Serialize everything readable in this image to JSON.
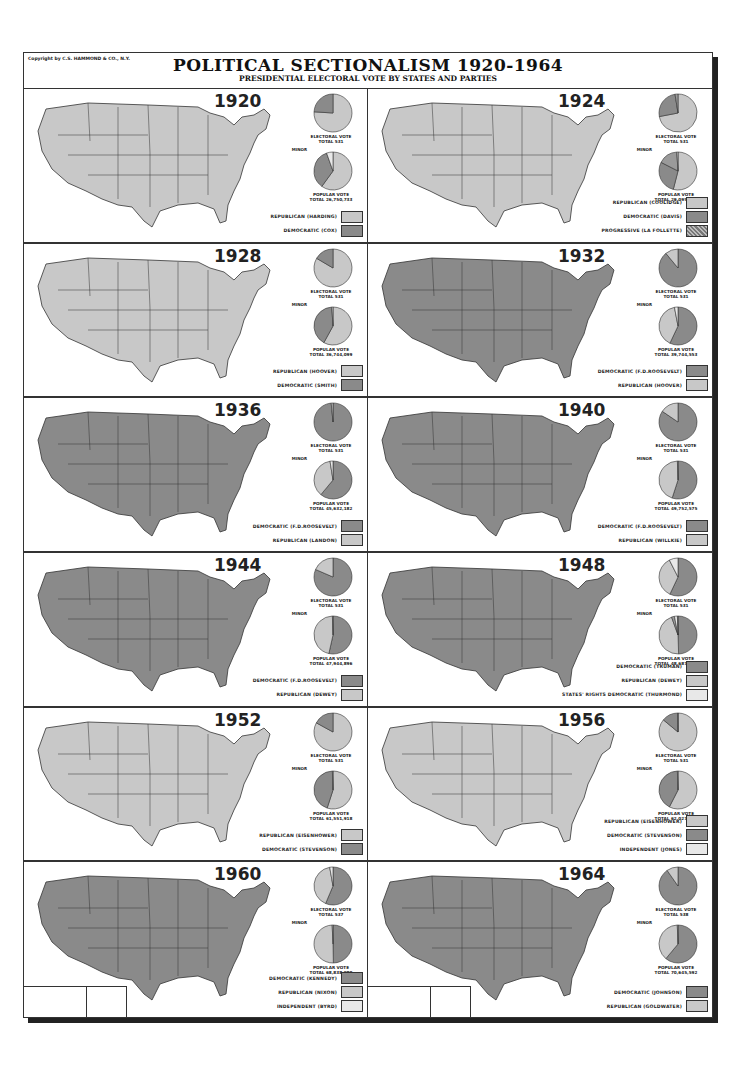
{
  "header": {
    "copyright": "Copyright by C.S. HAMMOND & CO., N.Y.",
    "title": "POLITICAL SECTIONALISM 1920-1964",
    "subtitle": "PRESIDENTIAL ELECTORAL VOTE BY STATES AND PARTIES"
  },
  "colors": {
    "republican": "#c8c8c8",
    "democratic": "#8a8a8a",
    "third": "#e8e8e8",
    "border": "#333333"
  },
  "panels": [
    {
      "year": "1920",
      "electoral_label": "ELECTORAL VOTE",
      "electoral_total": "TOTAL 531",
      "popular_label": "POPULAR VOTE",
      "popular_total": "TOTAL 26,750,733",
      "minor_label": "MINOR",
      "minor_text": "5 1/2% 1,466,170",
      "legend": [
        {
          "label": "REPUBLICAN (HARDING)",
          "party": "rep"
        },
        {
          "label": "DEMOCRATIC (COX)",
          "party": "dem"
        }
      ]
    },
    {
      "year": "1924",
      "electoral_label": "ELECTORAL VOTE",
      "electoral_total": "TOTAL 531",
      "popular_label": "POPULAR VOTE",
      "popular_total": "TOTAL 29,095,209",
      "minor_label": "MINOR",
      "minor_text": "1% 155,800 / 16 1/2% 4,822,856",
      "legend": [
        {
          "label": "REPUBLICAN (COOLIDGE)",
          "party": "rep"
        },
        {
          "label": "DEMOCRATIC (DAVIS)",
          "party": "dem"
        },
        {
          "label": "PROGRESSIVE (LA FOLLETTE)",
          "party": "prog"
        }
      ]
    },
    {
      "year": "1928",
      "electoral_label": "ELECTORAL VOTE",
      "electoral_total": "TOTAL 531",
      "popular_label": "POPULAR VOTE",
      "popular_total": "TOTAL 36,744,099",
      "minor_label": "MINOR",
      "minor_text": "1% 337,115",
      "legend": [
        {
          "label": "REPUBLICAN (HOOVER)",
          "party": "rep"
        },
        {
          "label": "DEMOCRATIC (SMITH)",
          "party": "dem"
        }
      ]
    },
    {
      "year": "1932",
      "electoral_label": "ELECTORAL VOTE",
      "electoral_total": "TOTAL 531",
      "popular_label": "POPULAR VOTE",
      "popular_total": "TOTAL 39,744,553",
      "minor_label": "MINOR",
      "minor_text": "3% 1,160,615",
      "legend": [
        {
          "label": "DEMOCRATIC (F.D.ROOSEVELT)",
          "party": "dem"
        },
        {
          "label": "REPUBLICAN (HOOVER)",
          "party": "rep"
        }
      ]
    },
    {
      "year": "1936",
      "electoral_label": "ELECTORAL VOTE",
      "electoral_total": "TOTAL 531",
      "popular_label": "POPULAR VOTE",
      "popular_total": "TOTAL 45,632,182",
      "minor_label": "MINOR",
      "minor_text": "2 1/2% 1,208,083",
      "legend": [
        {
          "label": "DEMOCRATIC (F.D.ROOSEVELT)",
          "party": "dem"
        },
        {
          "label": "REPUBLICAN (LANDON)",
          "party": "rep"
        }
      ]
    },
    {
      "year": "1940",
      "electoral_label": "ELECTORAL VOTE",
      "electoral_total": "TOTAL 531",
      "popular_label": "POPULAR VOTE",
      "popular_total": "TOTAL 49,752,575",
      "minor_label": "MINOR",
      "minor_text": "1/2% 203,626",
      "legend": [
        {
          "label": "DEMOCRATIC (F.D.ROOSEVELT)",
          "party": "dem"
        },
        {
          "label": "REPUBLICAN (WILLKIE)",
          "party": "rep"
        }
      ]
    },
    {
      "year": "1944",
      "electoral_label": "ELECTORAL VOTE",
      "electoral_total": "TOTAL 531",
      "popular_label": "POPULAR VOTE",
      "popular_total": "TOTAL 47,944,896",
      "minor_label": "MINOR",
      "minor_text": "1/2% 346,651",
      "legend": [
        {
          "label": "DEMOCRATIC (F.D.ROOSEVELT)",
          "party": "dem"
        },
        {
          "label": "REPUBLICAN (DEWEY)",
          "party": "rep"
        }
      ]
    },
    {
      "year": "1948",
      "electoral_label": "ELECTORAL VOTE",
      "electoral_total": "TOTAL 531",
      "popular_label": "POPULAR VOTE",
      "popular_total": "TOTAL 48,687,498",
      "minor_label": "MINOR",
      "minor_text": "1/2% 289,609 / PROGRESSIVE (WALLACE) 2 1/2% 1,157,172 / 2 1/2% 1,169,021",
      "legend": [
        {
          "label": "DEMOCRATIC (TRUMAN)",
          "party": "dem"
        },
        {
          "label": "REPUBLICAN (DEWEY)",
          "party": "rep"
        },
        {
          "label": "STATES' RIGHTS DEMOCRATIC (THURMOND)",
          "party": "third"
        }
      ]
    },
    {
      "year": "1952",
      "electoral_label": "ELECTORAL VOTE",
      "electoral_total": "TOTAL 531",
      "popular_label": "POPULAR VOTE",
      "popular_total": "TOTAL 61,551,918",
      "minor_label": "MINOR",
      "minor_text": "1/2% 289,839",
      "legend": [
        {
          "label": "REPUBLICAN (EISENHOWER)",
          "party": "rep"
        },
        {
          "label": "DEMOCRATIC (STEVENSON)",
          "party": "dem"
        }
      ]
    },
    {
      "year": "1956",
      "electoral_label": "ELECTORAL VOTE",
      "electoral_total": "TOTAL 531",
      "popular_label": "POPULAR VOTE",
      "popular_total": "TOTAL 62,027,040",
      "minor_label": "MINOR",
      "minor_text": "1/2% 414,712",
      "legend": [
        {
          "label": "REPUBLICAN (EISENHOWER)",
          "party": "rep"
        },
        {
          "label": "DEMOCRATIC (STEVENSON)",
          "party": "dem"
        },
        {
          "label": "INDEPENDENT (JONES)",
          "party": "third"
        }
      ]
    },
    {
      "year": "1960",
      "electoral_label": "ELECTORAL VOTE",
      "electoral_total": "TOTAL 537",
      "popular_label": "POPULAR VOTE",
      "popular_total": "TOTAL 68,838,980",
      "minor_label": "MINOR",
      "minor_text": ".7% 503,643",
      "legend": [
        {
          "label": "DEMOCRATIC (KENNEDY)",
          "party": "dem"
        },
        {
          "label": "REPUBLICAN (NIXON)",
          "party": "rep"
        },
        {
          "label": "INDEPENDENT (BYRD)",
          "party": "third"
        }
      ]
    },
    {
      "year": "1964",
      "electoral_label": "ELECTORAL VOTE",
      "electoral_total": "TOTAL 538",
      "popular_label": "POPULAR VOTE",
      "popular_total": "TOTAL 70,645,592",
      "minor_label": "MINOR",
      "minor_text": ".6%",
      "legend": [
        {
          "label": "DEMOCRATIC (JOHNSON)",
          "party": "dem"
        },
        {
          "label": "REPUBLICAN (GOLDWATER)",
          "party": "rep"
        }
      ]
    }
  ],
  "chart_data": [
    {
      "type": "pie",
      "title": "1920 Electoral Vote",
      "labels": [
        "Republican (Harding)",
        "Democratic (Cox)"
      ],
      "values": [
        76,
        24
      ],
      "counts": [
        404,
        127
      ],
      "total": 531
    },
    {
      "type": "pie",
      "title": "1920 Popular Vote",
      "labels": [
        "Republican (Harding)",
        "Democratic (Cox)",
        "Minor"
      ],
      "values": [
        60,
        34.5,
        5.5
      ],
      "counts": [
        16152200,
        9147353,
        1466170
      ],
      "total": 26750733
    },
    {
      "type": "pie",
      "title": "1924 Electoral Vote",
      "labels": [
        "Republican (Coolidge)",
        "Democratic (Davis)",
        "Progressive (La Follette)"
      ],
      "values": [
        72,
        25.5,
        2.5
      ],
      "counts": [
        382,
        136,
        13
      ],
      "total": 531
    },
    {
      "type": "pie",
      "title": "1924 Popular Vote",
      "labels": [
        "Republican (Coolidge)",
        "Democratic (Davis)",
        "Progressive (La Follette)",
        "Minor"
      ],
      "values": [
        54,
        28.5,
        16.5,
        1
      ],
      "counts": [
        15725016,
        8386503,
        4822856,
        155800
      ],
      "total": 29095209
    },
    {
      "type": "pie",
      "title": "1928 Electoral Vote",
      "labels": [
        "Republican (Hoover)",
        "Democratic (Smith)"
      ],
      "values": [
        83.5,
        16.5
      ],
      "counts": [
        444,
        87
      ],
      "total": 531
    },
    {
      "type": "pie",
      "title": "1928 Popular Vote",
      "labels": [
        "Republican (Hoover)",
        "Democratic (Smith)",
        "Minor"
      ],
      "values": [
        58,
        41,
        1
      ],
      "counts": [
        21391381,
        15016443,
        337115
      ],
      "total": 36744099
    },
    {
      "type": "pie",
      "title": "1932 Electoral Vote",
      "labels": [
        "Democratic (F.D. Roosevelt)",
        "Republican (Hoover)"
      ],
      "values": [
        89,
        11
      ],
      "counts": [
        472,
        59
      ],
      "total": 531
    },
    {
      "type": "pie",
      "title": "1932 Popular Vote",
      "labels": [
        "Democratic (F.D. Roosevelt)",
        "Republican (Hoover)",
        "Minor"
      ],
      "values": [
        57,
        40,
        3
      ],
      "counts": [
        22821857,
        15761841,
        1160615
      ],
      "total": 39744553
    },
    {
      "type": "pie",
      "title": "1936 Electoral Vote",
      "labels": [
        "Democratic (F.D. Roosevelt)",
        "Republican (Landon)"
      ],
      "values": [
        98.5,
        1.5
      ],
      "counts": [
        523,
        8
      ],
      "total": 531
    },
    {
      "type": "pie",
      "title": "1936 Popular Vote",
      "labels": [
        "Democratic (F.D. Roosevelt)",
        "Republican (Landon)",
        "Minor"
      ],
      "values": [
        61,
        36.5,
        2.5
      ],
      "counts": [
        27751597,
        16679583,
        1208083
      ],
      "total": 45632182
    },
    {
      "type": "pie",
      "title": "1940 Electoral Vote",
      "labels": [
        "Democratic (F.D. Roosevelt)",
        "Republican (Willkie)"
      ],
      "values": [
        84.5,
        15.5
      ],
      "counts": [
        449,
        82
      ],
      "total": 531
    },
    {
      "type": "pie",
      "title": "1940 Popular Vote",
      "labels": [
        "Democratic (F.D. Roosevelt)",
        "Republican (Willkie)",
        "Minor"
      ],
      "values": [
        55,
        44.5,
        0.5
      ],
      "counts": [
        27244160,
        22305198,
        203626
      ],
      "total": 49752575
    },
    {
      "type": "pie",
      "title": "1944 Electoral Vote",
      "labels": [
        "Democratic (F.D. Roosevelt)",
        "Republican (Dewey)"
      ],
      "values": [
        81.5,
        18.5
      ],
      "counts": [
        432,
        99
      ],
      "total": 531
    },
    {
      "type": "pie",
      "title": "1944 Popular Vote",
      "labels": [
        "Democratic (F.D. Roosevelt)",
        "Republican (Dewey)",
        "Minor"
      ],
      "values": [
        53.5,
        46,
        0.5
      ],
      "counts": [
        25602505,
        22006278,
        346651
      ],
      "total": 47944896
    },
    {
      "type": "pie",
      "title": "1948 Electoral Vote",
      "labels": [
        "Democratic (Truman)",
        "Republican (Dewey)",
        "States' Rights Democratic (Thurmond)"
      ],
      "values": [
        57,
        35.5,
        7.5
      ],
      "counts": [
        303,
        189,
        39
      ],
      "total": 531
    },
    {
      "type": "pie",
      "title": "1948 Popular Vote",
      "labels": [
        "Democratic (Truman)",
        "Republican (Dewey)",
        "Progressive (Wallace)",
        "States' Rights (Thurmond)",
        "Minor"
      ],
      "values": [
        49.5,
        45,
        2.5,
        2.5,
        0.5
      ],
      "counts": [
        24105812,
        21970065,
        1157172,
        1169021,
        289609
      ],
      "total": 48687498
    },
    {
      "type": "pie",
      "title": "1952 Electoral Vote",
      "labels": [
        "Republican (Eisenhower)",
        "Democratic (Stevenson)"
      ],
      "values": [
        83,
        17
      ],
      "counts": [
        442,
        89
      ],
      "total": 531
    },
    {
      "type": "pie",
      "title": "1952 Popular Vote",
      "labels": [
        "Republican (Eisenhower)",
        "Democratic (Stevenson)",
        "Minor"
      ],
      "values": [
        55,
        44.5,
        0.5
      ],
      "counts": [
        33936252,
        27314992,
        289839
      ],
      "total": 61551918
    },
    {
      "type": "pie",
      "title": "1956 Electoral Vote",
      "labels": [
        "Republican (Eisenhower)",
        "Democratic (Stevenson)",
        "Independent (Jones)"
      ],
      "values": [
        86,
        13.8,
        0.2
      ],
      "counts": [
        457,
        73,
        1
      ],
      "total": 531
    },
    {
      "type": "pie",
      "title": "1956 Popular Vote",
      "labels": [
        "Republican (Eisenhower)",
        "Democratic (Stevenson)",
        "Minor"
      ],
      "values": [
        57.5,
        42,
        0.5
      ],
      "counts": [
        35585316,
        26031322,
        414712
      ],
      "total": 62027040
    },
    {
      "type": "pie",
      "title": "1960 Electoral Vote",
      "labels": [
        "Democratic (Kennedy)",
        "Republican (Nixon)",
        "Independent (Byrd)"
      ],
      "values": [
        56.4,
        40.8,
        2.8
      ],
      "counts": [
        303,
        219,
        15
      ],
      "total": 537
    },
    {
      "type": "pie",
      "title": "1960 Popular Vote",
      "labels": [
        "Democratic (Kennedy)",
        "Republican (Nixon)",
        "Minor"
      ],
      "values": [
        49.7,
        49.6,
        0.7
      ],
      "counts": [
        34227096,
        34108546,
        503643
      ],
      "total": 68838980
    },
    {
      "type": "pie",
      "title": "1964 Electoral Vote",
      "labels": [
        "Democratic (Johnson)",
        "Republican (Goldwater)"
      ],
      "values": [
        90.3,
        9.7
      ],
      "counts": [
        486,
        52
      ],
      "total": 538
    },
    {
      "type": "pie",
      "title": "1964 Popular Vote",
      "labels": [
        "Democratic (Johnson)",
        "Republican (Goldwater)",
        "Minor"
      ],
      "values": [
        61,
        38.4,
        0.6
      ],
      "counts": [
        43126506,
        27176799,
        342287
      ],
      "total": 70645592
    }
  ]
}
